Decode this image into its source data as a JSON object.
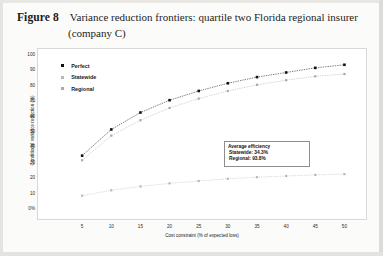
{
  "figure": {
    "label": "Figure 8",
    "title_line1": "Variance reduction frontiers: quartile two Florida regional insurer",
    "title_line2": "(company C)"
  },
  "legend": {
    "position": "inside-top-left",
    "items": [
      {
        "label": "Perfect",
        "color": "#111111",
        "marker": "filled-square"
      },
      {
        "label": "Statewide",
        "color": "#b9b9b9",
        "marker": "filled-square"
      },
      {
        "label": "Regional",
        "color": "#a9a9a9",
        "marker": "filled-square"
      }
    ]
  },
  "annotation": {
    "title": "Average efficiency",
    "rows": [
      {
        "label": "Statewide:",
        "value": "34.3%"
      },
      {
        "label": "Regional:",
        "value": "93.8%"
      }
    ],
    "statewide_text": "Statewide:  34.3%",
    "regional_text": "Regional:  93.8%"
  },
  "chart_data": {
    "type": "line",
    "title": "Variance reduction frontiers: quartile two Florida regional insurer (company C)",
    "xlabel": "Cost constraint (% of expected loss)",
    "ylabel": "Conditional variance reduction (%)",
    "x": [
      5,
      10,
      15,
      20,
      25,
      30,
      35,
      40,
      45,
      50
    ],
    "xlim": [
      0,
      52.5
    ],
    "ylim": [
      0,
      100
    ],
    "xticks": [
      5,
      10,
      15,
      20,
      25,
      30,
      35,
      40,
      45,
      50
    ],
    "xtick_labels": [
      "5",
      "10",
      "15",
      "20",
      "25",
      "30",
      "35",
      "40",
      "45",
      "50"
    ],
    "yticks": [
      0,
      10,
      20,
      30,
      40,
      50,
      60,
      70,
      80,
      90,
      100
    ],
    "ytick_labels": [
      "0%",
      "10",
      "20",
      "30",
      "40",
      "50",
      "60",
      "70",
      "80",
      "90",
      "100"
    ],
    "grid": false,
    "legend": [
      "Perfect",
      "Statewide",
      "Regional"
    ],
    "series": [
      {
        "name": "Perfect",
        "color": "#111111",
        "values": [
          34,
          51,
          62,
          70,
          76,
          81,
          85,
          88,
          91,
          93
        ]
      },
      {
        "name": "Statewide",
        "color": "#b9b9b9",
        "values": [
          8,
          11.5,
          14,
          16,
          17.5,
          19,
          20,
          20.8,
          21.5,
          22
        ]
      },
      {
        "name": "Regional",
        "color": "#a9a9a9",
        "values": [
          31,
          47,
          57,
          65,
          71,
          76,
          80,
          83,
          85.5,
          87
        ]
      }
    ]
  }
}
